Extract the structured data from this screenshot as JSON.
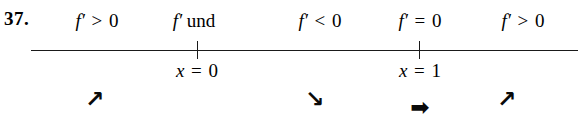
{
  "exercise": {
    "number_label": "37."
  },
  "number_line": {
    "line_color": "#1a1a1a",
    "ticks": [
      {
        "name": "tick-x-0",
        "x": 197
      },
      {
        "name": "tick-x-1",
        "x": 419
      }
    ]
  },
  "labels_above": [
    {
      "name": "interval-label-1",
      "x": 97,
      "function": "f",
      "prime": "′",
      "relation": ">",
      "value": "0",
      "text": "f′ > 0"
    },
    {
      "name": "point-label-und-x-0",
      "x": 194,
      "function": "f",
      "prime": "′",
      "relation": "und",
      "value": "",
      "text": "f′ und"
    },
    {
      "name": "interval-label-2",
      "x": 320,
      "function": "f",
      "prime": "′",
      "relation": "<",
      "value": "0",
      "text": "f′ < 0"
    },
    {
      "name": "point-label-x-1",
      "x": 420,
      "function": "f",
      "prime": "′",
      "relation": "=",
      "value": "0",
      "text": "f′ = 0"
    },
    {
      "name": "interval-label-3",
      "x": 523,
      "function": "f",
      "prime": "′",
      "relation": ">",
      "value": "0",
      "text": "f′ > 0"
    }
  ],
  "labels_below": [
    {
      "name": "axis-point-label-x-0",
      "x": 197,
      "variable": "x",
      "relation": "=",
      "value": "0",
      "text": "x = 0"
    },
    {
      "name": "axis-point-label-x-1",
      "x": 420,
      "variable": "x",
      "relation": "=",
      "value": "1",
      "text": "x = 1"
    }
  ],
  "arrows": [
    {
      "name": "arrow-increasing-1",
      "x": 95,
      "y": 88,
      "glyph": "↗",
      "meaning": "increasing"
    },
    {
      "name": "arrow-decreasing-1",
      "x": 315,
      "y": 88,
      "glyph": "↘",
      "meaning": "decreasing"
    },
    {
      "name": "arrow-constant-1",
      "x": 420,
      "y": 96,
      "glyph": "➡",
      "meaning": "horizontal-tangent"
    },
    {
      "name": "arrow-increasing-2",
      "x": 507,
      "y": 88,
      "glyph": "↗",
      "meaning": "increasing"
    }
  ]
}
